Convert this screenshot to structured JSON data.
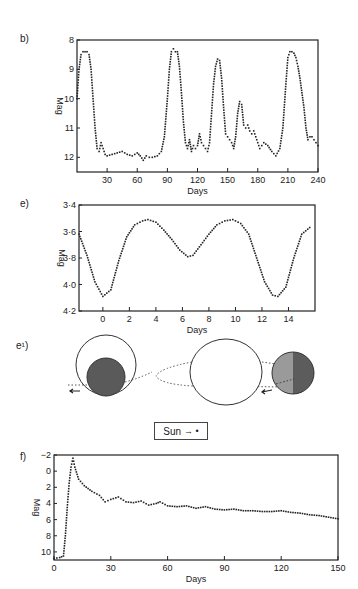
{
  "panels": {
    "b": {
      "label": "b)"
    },
    "e": {
      "label": "e)"
    },
    "e1": {
      "label": "e¹)"
    },
    "f": {
      "label": "f)"
    }
  },
  "legend": {
    "sun_label": "Sun",
    "sun_arrow": "→ •"
  },
  "chart_data": [
    {
      "id": "b",
      "type": "scatter",
      "title": "",
      "xlabel": "Days",
      "ylabel": "Mag",
      "xlim": [
        0,
        240
      ],
      "ylim": [
        12.5,
        8
      ],
      "y_inverted": true,
      "xticks": [
        30,
        60,
        90,
        120,
        150,
        180,
        210,
        240
      ],
      "yticks": [
        8,
        9,
        10,
        11,
        12
      ],
      "grid": false,
      "x": [
        0,
        2,
        4,
        6,
        8,
        10,
        12,
        14,
        16,
        18,
        20,
        22,
        24,
        26,
        28,
        30,
        35,
        40,
        45,
        50,
        55,
        60,
        63,
        66,
        69,
        72,
        75,
        80,
        84,
        87,
        90,
        92,
        94,
        96,
        98,
        100,
        102,
        104,
        106,
        108,
        110,
        112,
        114,
        116,
        118,
        120,
        122,
        124,
        126,
        128,
        130,
        132,
        134,
        136,
        138,
        140,
        142,
        144,
        146,
        148,
        150,
        152,
        154,
        156,
        158,
        160,
        162,
        164,
        166,
        168,
        170,
        172,
        174,
        176,
        178,
        180,
        182,
        184,
        186,
        190,
        194,
        198,
        202,
        205,
        208,
        210,
        212,
        214,
        216,
        218,
        220,
        222,
        224,
        226,
        228,
        230,
        232,
        234,
        236,
        238,
        240
      ],
      "values": [
        10.0,
        9.0,
        8.5,
        8.4,
        8.4,
        8.4,
        8.5,
        9.0,
        10.0,
        11.0,
        11.7,
        11.8,
        11.5,
        11.7,
        11.9,
        11.95,
        11.9,
        11.85,
        11.8,
        11.9,
        11.95,
        11.85,
        11.95,
        12.1,
        11.95,
        12.0,
        12.0,
        11.95,
        11.8,
        11.3,
        10.0,
        9.0,
        8.4,
        8.3,
        8.4,
        8.4,
        8.9,
        9.8,
        10.8,
        11.5,
        11.7,
        11.4,
        11.8,
        11.6,
        11.7,
        11.6,
        11.2,
        11.5,
        11.6,
        11.7,
        11.8,
        11.5,
        10.5,
        9.5,
        8.9,
        8.65,
        8.7,
        9.3,
        10.3,
        11.2,
        11.3,
        11.4,
        11.5,
        11.7,
        11.3,
        10.5,
        10.1,
        10.2,
        10.9,
        11.0,
        10.9,
        11.1,
        11.2,
        11.1,
        11.3,
        11.5,
        11.7,
        11.6,
        11.5,
        11.6,
        11.8,
        11.95,
        11.7,
        11.0,
        9.5,
        8.6,
        8.4,
        8.4,
        8.45,
        8.6,
        8.9,
        9.3,
        9.8,
        10.3,
        11.0,
        11.4,
        11.3,
        11.3,
        11.4,
        11.5,
        11.6
      ]
    },
    {
      "id": "e",
      "type": "scatter",
      "title": "",
      "xlabel": "Days",
      "ylabel": "Mag",
      "xlim": [
        -1.8,
        16
      ],
      "ylim": [
        4.2,
        3.4
      ],
      "y_inverted": true,
      "xticks": [
        0,
        2,
        4,
        6,
        8,
        10,
        12,
        14
      ],
      "ytick_labels": [
        "3·4",
        "3·6",
        "3·8",
        "4·0",
        "4·2"
      ],
      "yticks": [
        3.4,
        3.6,
        3.8,
        4.0,
        4.2
      ],
      "grid": false,
      "x": [
        -1.8,
        -1.2,
        -0.6,
        0,
        0.6,
        1.2,
        1.8,
        2.4,
        3.0,
        3.4,
        4.0,
        4.6,
        5.2,
        5.8,
        6.4,
        6.8,
        7.4,
        8.0,
        8.6,
        9.2,
        9.8,
        10.4,
        11.0,
        11.6,
        12.2,
        12.8,
        13.2,
        13.8,
        14.4,
        15.0,
        15.6
      ],
      "values": [
        3.62,
        3.78,
        3.98,
        4.09,
        4.04,
        3.82,
        3.64,
        3.55,
        3.52,
        3.51,
        3.53,
        3.59,
        3.66,
        3.74,
        3.79,
        3.78,
        3.7,
        3.62,
        3.55,
        3.52,
        3.51,
        3.54,
        3.62,
        3.8,
        3.98,
        4.08,
        4.09,
        4.02,
        3.8,
        3.62,
        3.57
      ]
    },
    {
      "id": "f",
      "type": "scatter",
      "title": "",
      "xlabel": "Days",
      "ylabel": "Mag",
      "xlim": [
        0,
        150
      ],
      "ylim": [
        11,
        -2
      ],
      "y_inverted": true,
      "xticks": [
        0,
        30,
        60,
        90,
        120,
        150
      ],
      "yticks": [
        -2,
        0,
        2,
        4,
        6,
        8,
        10
      ],
      "grid": false,
      "x": [
        0,
        3,
        5,
        6,
        7,
        8,
        9,
        10,
        11,
        13,
        16,
        20,
        24,
        27,
        30,
        34,
        38,
        42,
        46,
        50,
        54,
        56,
        60,
        65,
        70,
        75,
        80,
        85,
        90,
        95,
        100,
        105,
        110,
        115,
        120,
        125,
        130,
        135,
        140,
        145,
        150
      ],
      "values": [
        10.8,
        10.7,
        10.5,
        8.0,
        4.5,
        1.5,
        -0.5,
        -1.6,
        -0.5,
        1.0,
        1.8,
        2.5,
        3.0,
        3.8,
        3.5,
        3.2,
        3.8,
        3.9,
        3.7,
        4.2,
        4.0,
        3.8,
        4.3,
        4.4,
        4.3,
        4.6,
        4.4,
        4.7,
        4.8,
        4.7,
        4.9,
        4.9,
        5.0,
        5.0,
        4.9,
        5.1,
        5.2,
        5.4,
        5.5,
        5.7,
        5.9
      ]
    }
  ],
  "diagram": {
    "type": "eclipsing-binary-orbit"
  }
}
